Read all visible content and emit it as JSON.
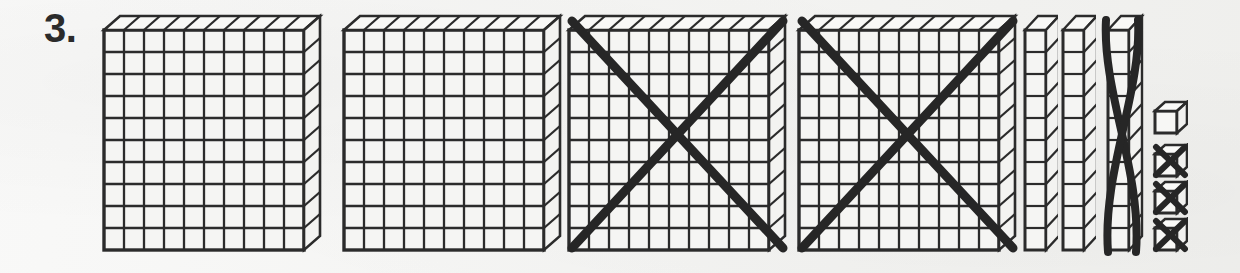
{
  "page": {
    "background_color": "#f1f1ef",
    "ink_color": "#2b2b2b"
  },
  "problem": {
    "number_label": "3.",
    "number_value": 3
  },
  "blocks": {
    "flats": {
      "name": "hundreds-flat",
      "unit_value": 100,
      "grid_rows": 10,
      "grid_cols": 10,
      "total": 4,
      "crossed_out": 2,
      "remaining": 2,
      "items": [
        {
          "index": 1,
          "crossed_out": false,
          "value": 100
        },
        {
          "index": 2,
          "crossed_out": false,
          "value": 100
        },
        {
          "index": 3,
          "crossed_out": true,
          "value": 100
        },
        {
          "index": 4,
          "crossed_out": true,
          "value": 100
        }
      ]
    },
    "rods": {
      "name": "tens-rod",
      "unit_value": 10,
      "grid_rows": 10,
      "grid_cols": 1,
      "total": 3,
      "crossed_out": 1,
      "remaining": 2,
      "items": [
        {
          "index": 1,
          "crossed_out": false,
          "value": 10
        },
        {
          "index": 2,
          "crossed_out": false,
          "value": 10
        },
        {
          "index": 3,
          "crossed_out": true,
          "value": 10
        }
      ]
    },
    "units": {
      "name": "ones-cube",
      "unit_value": 1,
      "total": 4,
      "crossed_out": 3,
      "remaining": 1,
      "items": [
        {
          "index": 1,
          "crossed_out": false,
          "value": 1
        },
        {
          "index": 2,
          "crossed_out": true,
          "value": 1
        },
        {
          "index": 3,
          "crossed_out": true,
          "value": 1
        },
        {
          "index": 4,
          "crossed_out": true,
          "value": 1
        }
      ]
    }
  },
  "math": {
    "shown_total": 434,
    "crossed_total": 213,
    "remaining_total": 221,
    "expression": "434 - 213 = 221"
  },
  "geometry": {
    "flat_positions_x": [
      100,
      340,
      565,
      795
    ],
    "flat_top_y": 12,
    "flat_width": 225,
    "flat_height": 240,
    "rod_positions_x": [
      1022,
      1060,
      1100
    ],
    "rod_top_y": 12,
    "rod_width": 28,
    "rod_height": 240,
    "cube_x": 1152,
    "cube_positions_y": [
      100,
      143,
      180,
      217
    ],
    "cube_size": 34
  }
}
